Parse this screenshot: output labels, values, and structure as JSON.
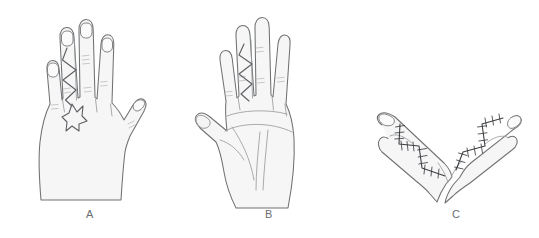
{
  "figure": {
    "background_color": "#ffffff",
    "skin_fill_color": "#f6f6f7",
    "outline_color": "#6f7173",
    "incision_color": "#5e6063",
    "suture_color": "#3d3f42",
    "panel_count": 3
  },
  "panels": [
    {
      "id": "panel-a",
      "label": "A",
      "view": "dorsal-hand-with-zigzag-incision-and-star-flap",
      "description": "Dorsal view of hand showing planned zigzag incision on the middle finger continuing to a star-shaped flap at the web space",
      "digits": [
        "thumb",
        "index",
        "middle",
        "ring",
        "little"
      ],
      "markings": [
        "zigzag-incision",
        "star-flap",
        "knuckle-creases",
        "fingernails"
      ]
    },
    {
      "id": "panel-b",
      "label": "B",
      "view": "palmar-hand-with-zigzag-incision",
      "description": "Palmar view of open hand showing zigzag incision along the middle finger with palmar creases",
      "digits": [
        "thumb",
        "index",
        "middle",
        "ring",
        "little"
      ],
      "markings": [
        "zigzag-incision",
        "palmar-creases",
        "thenar-crease",
        "finger-creases"
      ]
    },
    {
      "id": "panel-c",
      "label": "C",
      "view": "two-fingers-with-sutured-zigzag-closure",
      "description": "Two separated fingers forming a V, each with a completed zigzag incision closed with interrupted sutures",
      "digits": [
        "finger-left",
        "finger-right"
      ],
      "markings": [
        "sutured-zigzag-closure",
        "interrupted-stitches",
        "fingernails"
      ]
    }
  ]
}
